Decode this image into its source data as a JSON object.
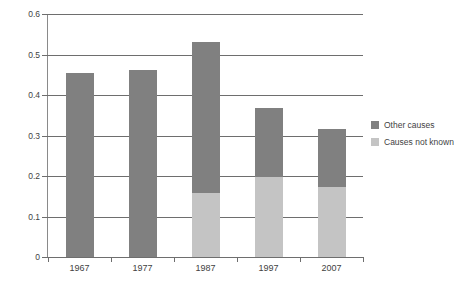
{
  "chart_data": {
    "type": "bar",
    "subtype": "stacked-bar",
    "title": "",
    "xlabel": "",
    "ylabel": "",
    "categories": [
      "1967",
      "1977",
      "1987",
      "1997",
      "2007"
    ],
    "series": [
      {
        "name": "Causes not known",
        "color": "#c4c4c4",
        "values": [
          0,
          0,
          0.158,
          0.198,
          0.174
        ]
      },
      {
        "name": "Other causes",
        "color": "#808080",
        "values": [
          0.455,
          0.463,
          0.373,
          0.17,
          0.143
        ]
      }
    ],
    "totals": [
      0.455,
      0.463,
      0.531,
      0.368,
      0.317
    ],
    "ylim": [
      0,
      0.6
    ],
    "ytick_values": [
      0,
      0.1,
      0.2,
      0.3,
      0.4,
      0.5,
      0.6
    ],
    "ytick_labels": [
      "0",
      "0.1",
      "0.2",
      "0.3",
      "0.4",
      "0.5",
      "0.6"
    ],
    "grid": true,
    "grid_axis": "y",
    "legend_position": "right",
    "legend_entries": [
      {
        "label": "Other causes",
        "color": "#808080"
      },
      {
        "label": "Causes not known",
        "color": "#c4c4c4"
      }
    ]
  }
}
